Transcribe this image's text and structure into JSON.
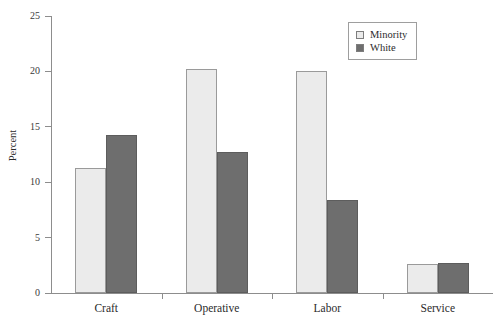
{
  "chart_data": {
    "type": "bar",
    "title": "",
    "subtitle": "",
    "xlabel": "",
    "ylabel": "Percent",
    "categories": [
      "Craft",
      "Operative",
      "Labor",
      "Service"
    ],
    "series": [
      {
        "name": "Minority",
        "color": "#ebebeb",
        "values": [
          11.3,
          20.2,
          20.0,
          2.6
        ]
      },
      {
        "name": "White",
        "color": "#6e6e6e",
        "values": [
          14.3,
          12.7,
          8.4,
          2.7
        ]
      }
    ],
    "ylim": [
      0,
      25
    ],
    "ytick_labels": [
      "0",
      "5",
      "10",
      "15",
      "20",
      "25"
    ],
    "ytick_values": [
      0,
      5,
      10,
      15,
      20,
      25
    ],
    "grid": false,
    "legend_position": "top-right",
    "axis_color": "#8d8d8d"
  },
  "legend": {
    "entries": [
      {
        "label": "Minority"
      },
      {
        "label": "White"
      }
    ]
  }
}
